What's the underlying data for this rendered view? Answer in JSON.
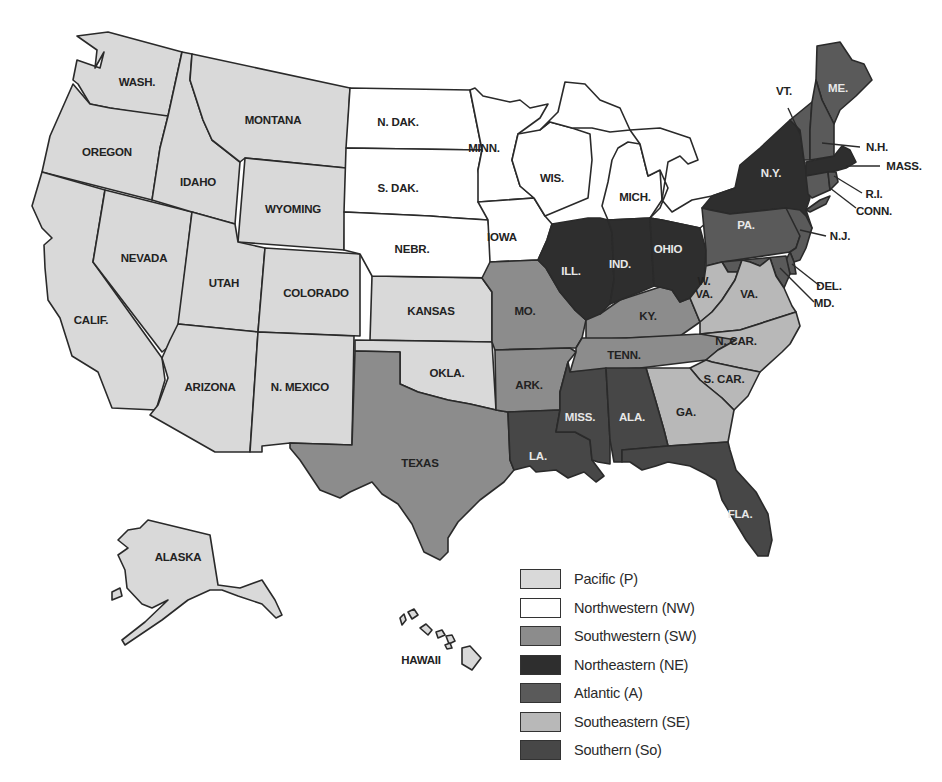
{
  "map": {
    "title": "",
    "colors": {
      "P": "#d9d9d9",
      "NW": "#ffffff",
      "SW": "#8c8c8c",
      "NE": "#2e2e2e",
      "A": "#5a5a5a",
      "SE": "#b8b8b8",
      "So": "#474747"
    },
    "states": [
      {
        "abbr": "WASH.",
        "region": "P"
      },
      {
        "abbr": "OREGON",
        "region": "P"
      },
      {
        "abbr": "CALIF.",
        "region": "P"
      },
      {
        "abbr": "NEVADA",
        "region": "P"
      },
      {
        "abbr": "IDAHO",
        "region": "P"
      },
      {
        "abbr": "MONTANA",
        "region": "P"
      },
      {
        "abbr": "WYOMING",
        "region": "P"
      },
      {
        "abbr": "UTAH",
        "region": "P"
      },
      {
        "abbr": "COLORADO",
        "region": "P"
      },
      {
        "abbr": "ARIZONA",
        "region": "P"
      },
      {
        "abbr": "N. MEXICO",
        "region": "P"
      },
      {
        "abbr": "KANSAS",
        "region": "P"
      },
      {
        "abbr": "OKLA.",
        "region": "P"
      },
      {
        "abbr": "ALASKA",
        "region": "P"
      },
      {
        "abbr": "HAWAII",
        "region": "P"
      },
      {
        "abbr": "N. DAK.",
        "region": "NW"
      },
      {
        "abbr": "S. DAK.",
        "region": "NW"
      },
      {
        "abbr": "NEBR.",
        "region": "NW"
      },
      {
        "abbr": "MINN.",
        "region": "NW"
      },
      {
        "abbr": "IOWA",
        "region": "NW"
      },
      {
        "abbr": "WIS.",
        "region": "NW"
      },
      {
        "abbr": "MICH.",
        "region": "NW"
      },
      {
        "abbr": "TEXAS",
        "region": "SW"
      },
      {
        "abbr": "MO.",
        "region": "SW"
      },
      {
        "abbr": "ARK.",
        "region": "SW"
      },
      {
        "abbr": "KY.",
        "region": "SW"
      },
      {
        "abbr": "TENN.",
        "region": "SW"
      },
      {
        "abbr": "ILL.",
        "region": "NE"
      },
      {
        "abbr": "IND.",
        "region": "NE"
      },
      {
        "abbr": "OHIO",
        "region": "NE"
      },
      {
        "abbr": "N.Y.",
        "region": "NE"
      },
      {
        "abbr": "MASS.",
        "region": "NE"
      },
      {
        "abbr": "ME.",
        "region": "A"
      },
      {
        "abbr": "VT.",
        "region": "A"
      },
      {
        "abbr": "N.H.",
        "region": "A"
      },
      {
        "abbr": "R.I.",
        "region": "A"
      },
      {
        "abbr": "CONN.",
        "region": "A"
      },
      {
        "abbr": "PA.",
        "region": "A"
      },
      {
        "abbr": "N.J.",
        "region": "A"
      },
      {
        "abbr": "DEL.",
        "region": "A"
      },
      {
        "abbr": "MD.",
        "region": "A"
      },
      {
        "abbr": "W. VA.",
        "region": "SE"
      },
      {
        "abbr": "VA.",
        "region": "SE"
      },
      {
        "abbr": "N. CAR.",
        "region": "SE"
      },
      {
        "abbr": "S. CAR.",
        "region": "SE"
      },
      {
        "abbr": "GA.",
        "region": "SE"
      },
      {
        "abbr": "LA.",
        "region": "So"
      },
      {
        "abbr": "MISS.",
        "region": "So"
      },
      {
        "abbr": "ALA.",
        "region": "So"
      },
      {
        "abbr": "FLA.",
        "region": "So"
      }
    ],
    "labels": {
      "wash": "WASH.",
      "oregon": "OREGON",
      "calif": "CALIF.",
      "nevada": "NEVADA",
      "idaho": "IDAHO",
      "montana": "MONTANA",
      "wyoming": "WYOMING",
      "utah": "UTAH",
      "colorado": "COLORADO",
      "arizona": "ARIZONA",
      "nmexico": "N. MEXICO",
      "kansas": "KANSAS",
      "okla": "OKLA.",
      "alaska": "ALASKA",
      "hawaii": "HAWAII",
      "ndak": "N. DAK.",
      "sdak": "S. DAK.",
      "nebr": "NEBR.",
      "minn": "MINN.",
      "iowa": "IOWA",
      "wis": "WIS.",
      "mich": "MICH.",
      "texas": "TEXAS",
      "mo": "MO.",
      "ark": "ARK.",
      "ky": "KY.",
      "tenn": "TENN.",
      "ill": "ILL.",
      "ind": "IND.",
      "ohio": "OHIO",
      "ny": "N.Y.",
      "mass": "MASS.",
      "me": "ME.",
      "vt": "VT.",
      "nh": "N.H.",
      "ri": "R.I.",
      "conn": "CONN.",
      "pa": "PA.",
      "nj": "N.J.",
      "del": "DEL.",
      "md": "MD.",
      "wva1": "W.",
      "wva2": "VA.",
      "va": "VA.",
      "ncar": "N. CAR.",
      "scar": "S. CAR.",
      "ga": "GA.",
      "la": "LA.",
      "miss": "MISS.",
      "ala": "ALA.",
      "fla": "FLA."
    }
  },
  "legend": {
    "items": [
      {
        "label": "Pacific (P)",
        "color": "#d9d9d9"
      },
      {
        "label": "Northwestern (NW)",
        "color": "#ffffff"
      },
      {
        "label": "Southwestern (SW)",
        "color": "#8c8c8c"
      },
      {
        "label": "Northeastern (NE)",
        "color": "#2e2e2e"
      },
      {
        "label": "Atlantic (A)",
        "color": "#5a5a5a"
      },
      {
        "label": "Southeastern (SE)",
        "color": "#b8b8b8"
      },
      {
        "label": "Southern (So)",
        "color": "#474747"
      }
    ]
  }
}
